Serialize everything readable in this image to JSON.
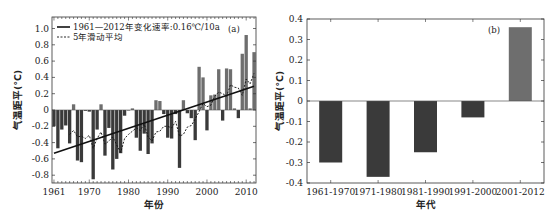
{
  "chart_data": [
    {
      "type": "bar",
      "panel_label": "(a)",
      "title": "",
      "xlabel": "年份",
      "ylabel": "气温距平(℃)",
      "ylim": [
        -0.9,
        1.1
      ],
      "xlim": [
        1960.5,
        2012.5
      ],
      "yticks": [
        1.0,
        0.8,
        0.6,
        0.4,
        0.2,
        0,
        -0.2,
        -0.4,
        -0.6,
        -0.8
      ],
      "ytick_labels": [
        "1.0",
        "0.8",
        "0.6",
        "0.4",
        "0.2",
        "0",
        "-0.2",
        "-0.4",
        "-0.6",
        "-0.8"
      ],
      "xticks": [
        1961,
        1970,
        1980,
        1990,
        2000,
        2010
      ],
      "xtick_labels": [
        "1961",
        "1970",
        "1980",
        "1990",
        "2000",
        "2010"
      ],
      "grid": false,
      "legend_position": "upper left",
      "x": [
        1961,
        1962,
        1963,
        1964,
        1965,
        1966,
        1967,
        1968,
        1969,
        1970,
        1971,
        1972,
        1973,
        1974,
        1975,
        1976,
        1977,
        1978,
        1979,
        1980,
        1981,
        1982,
        1983,
        1984,
        1985,
        1986,
        1987,
        1988,
        1989,
        1990,
        1991,
        1992,
        1993,
        1994,
        1995,
        1996,
        1997,
        1998,
        1999,
        2000,
        2001,
        2002,
        2003,
        2004,
        2005,
        2006,
        2007,
        2008,
        2009,
        2010,
        2011,
        2012
      ],
      "series": [
        {
          "name": "气温距平",
          "kind": "bar",
          "values": [
            -0.2,
            -0.47,
            -0.24,
            -0.19,
            -0.41,
            0.07,
            -0.62,
            -0.64,
            -0.01,
            -0.02,
            -0.85,
            -0.24,
            0.07,
            -0.56,
            -0.22,
            -0.73,
            -0.6,
            -0.53,
            -0.07,
            0.0,
            0.02,
            -0.34,
            -0.5,
            -0.29,
            -0.54,
            -0.41,
            0.12,
            0.11,
            -0.05,
            -0.34,
            -0.35,
            -0.05,
            -0.71,
            0.12,
            -0.04,
            -0.1,
            -0.37,
            0.53,
            0.4,
            -0.25,
            0.18,
            0.19,
            0.5,
            -0.13,
            0.51,
            0.5,
            0.02,
            -0.1,
            0.69,
            0.92,
            0.02,
            0.71
          ]
        },
        {
          "name": "1961—2012年变化速率:0.16℃/10a",
          "kind": "trend-line",
          "start": [
            1961,
            -0.53
          ],
          "end": [
            2012,
            0.29
          ]
        },
        {
          "name": "5年滑动平均",
          "kind": "dashed-line",
          "x": [
            1965,
            1966,
            1967,
            1968,
            1969,
            1970,
            1971,
            1972,
            1973,
            1974,
            1975,
            1976,
            1977,
            1978,
            1979,
            1980,
            1981,
            1982,
            1983,
            1984,
            1985,
            1986,
            1987,
            1988,
            1989,
            1990,
            1991,
            1992,
            1993,
            1994,
            1995,
            1996,
            1997,
            1998,
            1999,
            2000,
            2001,
            2002,
            2003,
            2004,
            2005,
            2006,
            2007,
            2008,
            2009,
            2010,
            2011,
            2012
          ],
          "values": [
            -0.3,
            -0.25,
            -0.33,
            -0.32,
            -0.35,
            -0.31,
            -0.47,
            -0.35,
            -0.27,
            -0.42,
            -0.38,
            -0.33,
            -0.43,
            -0.52,
            -0.35,
            -0.3,
            -0.26,
            -0.22,
            -0.25,
            -0.17,
            -0.33,
            -0.38,
            -0.27,
            -0.26,
            -0.2,
            -0.2,
            -0.22,
            -0.14,
            -0.32,
            -0.3,
            -0.21,
            -0.19,
            -0.11,
            -0.02,
            0.08,
            0.04,
            0.06,
            0.17,
            0.22,
            0.2,
            0.17,
            0.31,
            0.28,
            0.27,
            0.18,
            0.38,
            0.32,
            0.45
          ]
        }
      ],
      "legend": [
        "1961—2012年变化速率:0.16℃/10a",
        "5年滑动平均"
      ]
    },
    {
      "type": "bar",
      "panel_label": "(b)",
      "title": "",
      "xlabel": "年代",
      "ylabel": "气温距平(℃)",
      "ylim": [
        -0.4,
        0.4
      ],
      "yticks": [
        0.4,
        0.3,
        0.2,
        0.1,
        0,
        -0.1,
        -0.2,
        -0.3,
        -0.4
      ],
      "ytick_labels": [
        "0.4",
        "0.3",
        "0.2",
        "0.1",
        "0",
        "-0.1",
        "-0.2",
        "-0.3",
        "-0.4"
      ],
      "categories": [
        "1961-1970",
        "1971-1980",
        "1981-1990",
        "1991-2000",
        "2001-2012"
      ],
      "values": [
        -0.3,
        -0.37,
        -0.25,
        -0.08,
        0.36
      ],
      "grid": false
    }
  ],
  "colors": {
    "bar_negative": "#3a3a3a",
    "bar_positive": "#6e6e6e",
    "line": "#111111",
    "frame": "#333333"
  }
}
